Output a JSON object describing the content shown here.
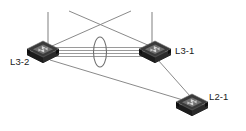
{
  "diagram": {
    "type": "network-topology",
    "canvas": {
      "width": 246,
      "height": 131,
      "background": "#ffffff"
    },
    "colors": {
      "link": "#8a8a8a",
      "bundle_link": "#9a9a9a",
      "ellipse_stroke": "#6e6e6e",
      "node_body_dark": "#1a1a1a",
      "node_body_mid": "#3d3d3d",
      "node_top": "#555555",
      "node_highlight": "#8c8c8c",
      "label_text": "#1a1a1a"
    },
    "nodes": [
      {
        "id": "l3-2",
        "label": "L3-2",
        "icon": "network-switch-icon",
        "layer": "L3",
        "x": 43,
        "y": 50,
        "label_x": 10,
        "label_y": 64,
        "label_anchor": "start"
      },
      {
        "id": "l3-1",
        "label": "L3-1",
        "icon": "network-switch-icon",
        "layer": "L3",
        "x": 155,
        "y": 50,
        "label_x": 175,
        "label_y": 53,
        "label_anchor": "start"
      },
      {
        "id": "l2-1",
        "label": "L2-1",
        "icon": "network-switch-icon",
        "layer": "L2",
        "x": 192,
        "y": 103,
        "label_x": 209,
        "label_y": 99,
        "label_anchor": "start"
      }
    ],
    "bundle": {
      "name": "link-aggregation-bundle",
      "from": "l3-2",
      "to": "l3-1",
      "link_count": 4,
      "x1": 57,
      "x2": 143,
      "y_offsets": [
        -4.5,
        -1.5,
        1.5,
        4.5
      ],
      "y_center": 52
    },
    "highlight_ellipse": {
      "name": "bundle-highlight-ellipse",
      "cx": 100,
      "cy": 52,
      "rx": 6.5,
      "ry": 15
    },
    "uplinks": [
      {
        "name": "uplink-stub-l3-2",
        "x1": 48,
        "y1": 43,
        "x2": 48,
        "y2": 12
      },
      {
        "name": "uplink-stub-l3-1",
        "x1": 152,
        "y1": 43,
        "x2": 152,
        "y2": 12
      }
    ],
    "cross_links": [
      {
        "name": "cross-link-l3-2-to-right",
        "x1": 52,
        "y1": 45,
        "x2": 130,
        "y2": 11
      },
      {
        "name": "cross-link-l3-1-to-left",
        "x1": 150,
        "y1": 45,
        "x2": 68,
        "y2": 11
      }
    ],
    "downlinks": [
      {
        "name": "downlink-l3-2-to-l2-1",
        "x1": 50,
        "y1": 58,
        "x2": 184,
        "y2": 99
      },
      {
        "name": "downlink-l3-1-to-l2-1",
        "x1": 157,
        "y1": 58,
        "x2": 190,
        "y2": 96
      }
    ]
  }
}
